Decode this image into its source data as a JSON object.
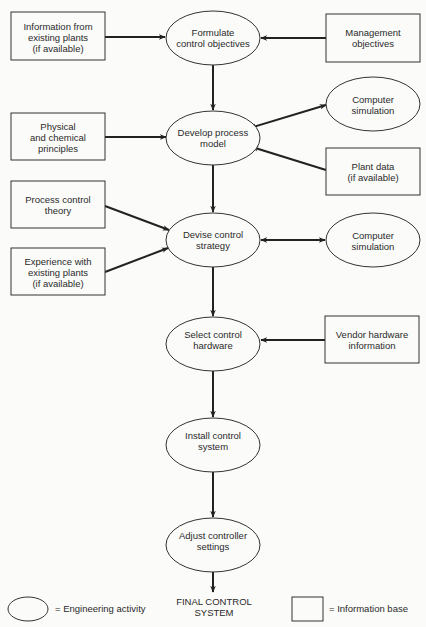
{
  "diagram": {
    "activities": [
      {
        "id": "formulate",
        "lines": [
          "Formulate",
          "control objectives"
        ],
        "cx": 213,
        "cy": 38
      },
      {
        "id": "develop",
        "lines": [
          "Develop process",
          "model"
        ],
        "cx": 213,
        "cy": 138
      },
      {
        "id": "devise",
        "lines": [
          "Devise control",
          "strategy"
        ],
        "cx": 213,
        "cy": 240
      },
      {
        "id": "select",
        "lines": [
          "Select control",
          "hardware"
        ],
        "cx": 213,
        "cy": 344
      },
      {
        "id": "install",
        "lines": [
          "Install control",
          "system"
        ],
        "cx": 213,
        "cy": 445
      },
      {
        "id": "adjust",
        "lines": [
          "Adjust controller",
          "settings"
        ],
        "cx": 213,
        "cy": 545
      },
      {
        "id": "sim1",
        "lines": [
          "Computer",
          "simulation"
        ],
        "cx": 373,
        "cy": 104
      },
      {
        "id": "sim2",
        "lines": [
          "Computer",
          "simulation"
        ],
        "cx": 373,
        "cy": 240
      }
    ],
    "information": [
      {
        "id": "info_existing",
        "lines": [
          "Information from",
          "existing plants",
          "(if available)"
        ],
        "x": 11,
        "y": 12,
        "w": 94,
        "h": 48
      },
      {
        "id": "physical",
        "lines": [
          "Physical",
          "and chemical",
          "principles"
        ],
        "x": 11,
        "y": 113,
        "w": 94,
        "h": 47
      },
      {
        "id": "pc_theory",
        "lines": [
          "Process control",
          "theory"
        ],
        "x": 11,
        "y": 181,
        "w": 94,
        "h": 47
      },
      {
        "id": "experience",
        "lines": [
          "Experience with",
          "existing plants",
          "(if available)"
        ],
        "x": 11,
        "y": 248,
        "w": 94,
        "h": 47
      },
      {
        "id": "management",
        "lines": [
          "Management",
          "objectives"
        ],
        "x": 326,
        "y": 14,
        "w": 94,
        "h": 48
      },
      {
        "id": "plant_data",
        "lines": [
          "Plant data",
          "(if available)"
        ],
        "x": 326,
        "y": 148,
        "w": 94,
        "h": 47
      },
      {
        "id": "vendor",
        "lines": [
          "Vendor hardware",
          "information"
        ],
        "x": 325,
        "y": 316,
        "w": 94,
        "h": 47
      }
    ],
    "final_output": [
      "FINAL CONTROL",
      "SYSTEM"
    ],
    "legend": {
      "activity_label": "= Engineering activity",
      "information_label": "= Information base"
    },
    "edges": [
      {
        "from": "info_existing",
        "to": "formulate"
      },
      {
        "from": "management",
        "to": "formulate"
      },
      {
        "from": "formulate",
        "to": "develop"
      },
      {
        "from": "physical",
        "to": "develop"
      },
      {
        "from": "develop",
        "to": "sim1",
        "bidirectional": true
      },
      {
        "from": "plant_data",
        "to": "develop"
      },
      {
        "from": "develop",
        "to": "devise"
      },
      {
        "from": "pc_theory",
        "to": "devise"
      },
      {
        "from": "experience",
        "to": "devise"
      },
      {
        "from": "devise",
        "to": "sim2",
        "bidirectional": true
      },
      {
        "from": "devise",
        "to": "select"
      },
      {
        "from": "vendor",
        "to": "select"
      },
      {
        "from": "select",
        "to": "install"
      },
      {
        "from": "install",
        "to": "adjust"
      },
      {
        "from": "adjust",
        "to": "final_output"
      }
    ]
  }
}
